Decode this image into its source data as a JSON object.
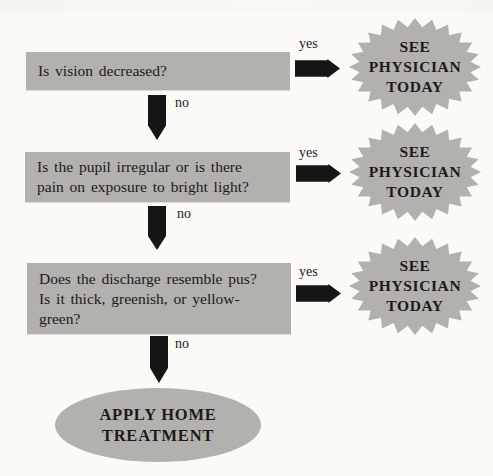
{
  "palette": {
    "background": "#fbfaf7",
    "shape_gray": "#b2b1ad",
    "arrow_black": "#161616",
    "text_black": "#1b1b1b"
  },
  "flowchart": {
    "questions": [
      {
        "lines": [
          "Is vision decreased?"
        ],
        "yes_label": "yes",
        "no_label": "no"
      },
      {
        "lines": [
          "Is the pupil irregular or is there",
          "pain on exposure to bright light?"
        ],
        "yes_label": "yes",
        "no_label": "no"
      },
      {
        "lines": [
          "Does the discharge resemble pus?",
          "Is it thick, greenish, or yellow-",
          "green?"
        ],
        "yes_label": "yes",
        "no_label": "no"
      }
    ],
    "physician_outcome": {
      "lines": [
        "SEE",
        "PHYSICIAN",
        "TODAY"
      ]
    },
    "home_outcome": {
      "lines": [
        "APPLY HOME",
        "TREATMENT"
      ]
    }
  }
}
